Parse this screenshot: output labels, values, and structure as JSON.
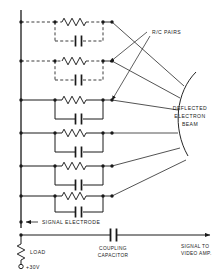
{
  "diagram": {
    "colors": {
      "line": "#1a1a1a",
      "background": "#ffffff"
    },
    "labels": {
      "rc_pairs": "R/C PAIRS",
      "deflected_beam_line1": "DEFLECTED",
      "deflected_beam_line2": "ELECTRON",
      "deflected_beam_line3": "BEAM",
      "signal_electrode": "SIGNAL ELECTRODE",
      "coupling_capacitor_line1": "COUPLING",
      "coupling_capacitor_line2": "CAPACITOR",
      "signal_out_line1": "SIGNAL TO",
      "signal_out_line2": "VIDEO AMP.",
      "load": "LOAD",
      "supply": "+30V"
    },
    "rc_pairs": [
      {
        "index": 1,
        "style": "dashed",
        "y": 22
      },
      {
        "index": 2,
        "style": "dashed",
        "y": 61
      },
      {
        "index": 3,
        "style": "solid",
        "y": 100
      },
      {
        "index": 4,
        "style": "solid",
        "y": 133
      },
      {
        "index": 5,
        "style": "solid",
        "y": 166
      },
      {
        "index": 6,
        "style": "solid",
        "y": 196
      }
    ],
    "components": {
      "resistor_count": 6,
      "capacitor_count": 6,
      "load_resistor": 1,
      "coupling_capacitor": 1
    }
  }
}
